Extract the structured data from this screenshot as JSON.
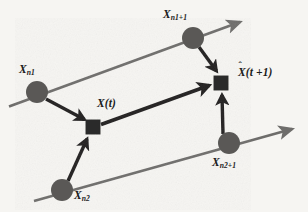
{
  "figure": {
    "type": "state-transition-diagram",
    "background_color": "#f6f5f2",
    "axis_color": "#6e6d6b",
    "node_color": "#5a5957",
    "arrow_color": "#211f1f",
    "text_color": "#1b1b1b"
  },
  "nodes": {
    "xn1": {
      "shape": "circle",
      "symbol": "X",
      "subscript": "n1",
      "label": "Xn1",
      "x": 37,
      "y": 92,
      "r": 11
    },
    "xn1_plus_1": {
      "shape": "circle",
      "symbol": "X",
      "subscript": "n1+1",
      "label": "Xn1+1",
      "x": 193,
      "y": 38,
      "r": 11
    },
    "xn2": {
      "shape": "circle",
      "symbol": "X",
      "subscript": "n2",
      "label": "Xn2",
      "x": 62,
      "y": 190,
      "r": 11
    },
    "xn2_plus_1": {
      "shape": "circle",
      "symbol": "X",
      "subscript": "n2+1",
      "label": "Xn2+1",
      "x": 229,
      "y": 143,
      "r": 11
    },
    "x_of_t": {
      "shape": "square",
      "symbol": "X",
      "argument": "(t)",
      "label": "X(t)",
      "x": 93,
      "y": 127,
      "size": 15
    },
    "x_hat_of_t_plus_1": {
      "shape": "square",
      "symbol": "X",
      "accent": "hat",
      "argument": "(t +1)",
      "label": "X(t +1)",
      "x": 221,
      "y": 83,
      "size": 15
    }
  },
  "labels": {
    "xn1": {
      "base": "X",
      "sub": "n1"
    },
    "xn1_plus_1": {
      "base": "X",
      "sub": "n1+1"
    },
    "x_of_t": {
      "text": "X(t)"
    },
    "x_hat_of_t_plus_1": {
      "hat": "ˆ",
      "base": "X",
      "arg": "(t +1)"
    },
    "xn2_plus_1": {
      "base": "X",
      "sub": "n2+1"
    },
    "xn2": {
      "base": "X",
      "sub": "n2"
    }
  },
  "axes": [
    {
      "name": "upper-timeline",
      "from_x": 9,
      "from_y": 106,
      "to_x": 245,
      "to_y": 20,
      "style": "gray-arrow",
      "passes_through": [
        "xn1",
        "xn1_plus_1"
      ]
    },
    {
      "name": "lower-timeline",
      "from_x": 34,
      "from_y": 201,
      "to_x": 297,
      "to_y": 127,
      "style": "gray-arrow",
      "passes_through": [
        "xn2",
        "xn2_plus_1"
      ]
    }
  ],
  "edges": [
    {
      "name": "xn1-to-xt",
      "from": "xn1",
      "to": "x_of_t",
      "style": "thick-black-arrow"
    },
    {
      "name": "xn2-to-xt",
      "from": "xn2",
      "to": "x_of_t",
      "style": "thick-black-arrow"
    },
    {
      "name": "xt-to-xhat",
      "from": "x_of_t",
      "to": "x_hat_of_t_plus_1",
      "style": "thick-black-arrow"
    },
    {
      "name": "xn1p1-to-xhat",
      "from": "xn1_plus_1",
      "to": "x_hat_of_t_plus_1",
      "style": "thick-black-arrow"
    },
    {
      "name": "xn2p1-to-xhat",
      "from": "xn2_plus_1",
      "to": "x_hat_of_t_plus_1",
      "style": "thick-black-arrow"
    }
  ]
}
